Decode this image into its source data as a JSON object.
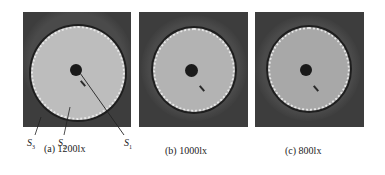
{
  "figure": {
    "panels": [
      {
        "id": "a",
        "caption": "(a) 1200lx",
        "illuminance_lx": 1200,
        "disk_color": "#bdbdbd"
      },
      {
        "id": "b",
        "caption": "(b) 1000lx",
        "illuminance_lx": 1000,
        "disk_color": "#b3b3b3"
      },
      {
        "id": "c",
        "caption": "(c) 800lx",
        "illuminance_lx": 800,
        "disk_color": "#a8a8a8"
      }
    ],
    "region_labels": [
      {
        "symbol": "S",
        "sub": "3"
      },
      {
        "symbol": "S",
        "sub": "2"
      },
      {
        "symbol": "S",
        "sub": "1"
      }
    ],
    "colors": {
      "background_region": "#3d3d3d",
      "center_dot": "#1a1a1a",
      "edge_dots": "#e8e8e8"
    }
  }
}
